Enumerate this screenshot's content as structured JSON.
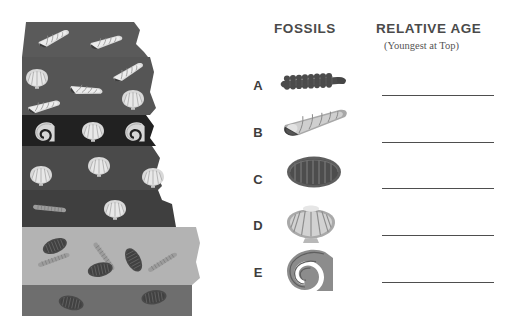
{
  "page": {
    "background": "#ffffff"
  },
  "headers": {
    "fossils": "FOSSILS",
    "relative_age": "RELATIVE AGE",
    "relative_age_sub": "(Youngest at Top)"
  },
  "rows": [
    {
      "letter": "A",
      "fossil": "segmented-crinoid-fossil",
      "letter_y": 78,
      "fossil_y": 65,
      "line_y": 95
    },
    {
      "letter": "B",
      "fossil": "conical-gastropod-shell-fossil",
      "letter_y": 125,
      "fossil_y": 108,
      "line_y": 142
    },
    {
      "letter": "C",
      "fossil": "oval-trilobite-fossil",
      "letter_y": 172,
      "fossil_y": 155,
      "line_y": 188
    },
    {
      "letter": "D",
      "fossil": "scallop-bivalve-shell-fossil",
      "letter_y": 218,
      "fossil_y": 200,
      "line_y": 235
    },
    {
      "letter": "E",
      "fossil": "spiral-ammonite-fossil",
      "letter_y": 265,
      "fossil_y": 248,
      "line_y": 282
    }
  ],
  "colors": {
    "layer_1": "#5a5a5a",
    "layer_2": "#555555",
    "layer_3": "#212121",
    "layer_4": "#4a4a4a",
    "layer_5": "#3f3f3f",
    "layer_6": "#b3b3b3",
    "layer_7": "#6e6e6e",
    "fossil_light": "#d6d6d6",
    "fossil_mid": "#9a9a9a",
    "fossil_dark": "#4f4f4f",
    "fossil_darkest": "#3a3a3a",
    "text": "#4a4a4a",
    "line": "#4e4e4e"
  },
  "strata": {
    "description": "Rock strata cross-section with fossils embedded in each layer",
    "layers": [
      {
        "name": "layer-1-shale",
        "color": "#5a5a5a",
        "top": 22,
        "bottom": 57,
        "fossils": "gastropod-shells"
      },
      {
        "name": "layer-2-sandstone",
        "color": "#555555",
        "top": 57,
        "bottom": 115,
        "fossils": "scallop-and-gastropod-shells"
      },
      {
        "name": "layer-3-dark-shale",
        "color": "#212121",
        "top": 115,
        "bottom": 146,
        "fossils": "ammonite-spirals-and-scallop"
      },
      {
        "name": "layer-4-limestone",
        "color": "#4a4a4a",
        "top": 146,
        "bottom": 190,
        "fossils": "scallop-shells"
      },
      {
        "name": "layer-5-mudstone",
        "color": "#3f3f3f",
        "top": 190,
        "bottom": 227,
        "fossils": "crinoid-and-scallop"
      },
      {
        "name": "layer-6-light-siltstone",
        "color": "#b3b3b3",
        "top": 227,
        "bottom": 285,
        "fossils": "trilobites-and-crinoids"
      },
      {
        "name": "layer-7-basement",
        "color": "#6e6e6e",
        "top": 285,
        "bottom": 316,
        "fossils": "trilobites"
      }
    ]
  }
}
